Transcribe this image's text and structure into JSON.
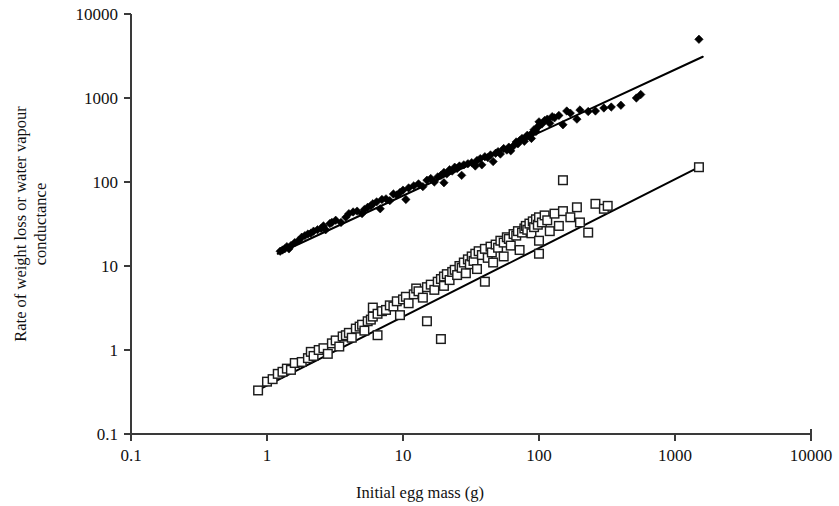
{
  "chart_data": {
    "type": "scatter",
    "title": "",
    "xlabel": "Initial egg mass (g)",
    "ylabel": "Rate of weight loss or water vapour conductance",
    "ylabel_line1": "Rate of weight loss or water vapour",
    "ylabel_line2": "conductance",
    "xscale": "log",
    "yscale": "log",
    "xlim": [
      0.1,
      10000
    ],
    "ylim": [
      0.1,
      10000
    ],
    "xticks": [
      "0.1",
      "1",
      "10",
      "100",
      "1000",
      "10000"
    ],
    "xtick_values": [
      0.1,
      1,
      10,
      100,
      1000,
      10000
    ],
    "yticks": [
      "0.1",
      "1",
      "10",
      "100",
      "1000",
      "10000"
    ],
    "ytick_values": [
      0.1,
      1,
      10,
      100,
      1000,
      10000
    ],
    "grid": false,
    "legend": false,
    "legend_position": "none",
    "marker_colors": {
      "rate_of_weight_loss": "#000000",
      "water_vapour_conductance": "#ffffff",
      "water_vapour_conductance_edge": "#1c1c1c",
      "trend_line": "#000000",
      "axis": "#3a3a3a"
    },
    "series": [
      {
        "name": "Rate of weight loss",
        "marker": "filled-diamond",
        "points": [
          [
            1.25,
            15.0
          ],
          [
            1.3,
            15.5
          ],
          [
            1.35,
            16.0
          ],
          [
            1.4,
            17.0
          ],
          [
            1.45,
            16.0
          ],
          [
            1.5,
            17.5
          ],
          [
            1.6,
            19.0
          ],
          [
            1.7,
            20.0
          ],
          [
            1.8,
            22.0
          ],
          [
            1.9,
            23.0
          ],
          [
            2.0,
            24.0
          ],
          [
            2.1,
            24.5
          ],
          [
            2.2,
            26.0
          ],
          [
            2.35,
            27.0
          ],
          [
            2.5,
            28.0
          ],
          [
            2.6,
            30.0
          ],
          [
            2.7,
            27.0
          ],
          [
            2.9,
            32.0
          ],
          [
            3.0,
            33.0
          ],
          [
            3.2,
            35.0
          ],
          [
            3.5,
            33.0
          ],
          [
            3.8,
            38.0
          ],
          [
            4.0,
            42.0
          ],
          [
            4.3,
            44.0
          ],
          [
            4.6,
            45.0
          ],
          [
            5.0,
            42.0
          ],
          [
            5.2,
            47.0
          ],
          [
            5.5,
            50.0
          ],
          [
            5.8,
            52.0
          ],
          [
            6.0,
            55.0
          ],
          [
            6.4,
            58.0
          ],
          [
            6.8,
            48.0
          ],
          [
            7.0,
            62.0
          ],
          [
            7.5,
            63.0
          ],
          [
            8.0,
            60.0
          ],
          [
            8.5,
            72.0
          ],
          [
            9.0,
            70.0
          ],
          [
            9.5,
            75.0
          ],
          [
            10.0,
            80.0
          ],
          [
            10.5,
            62.0
          ],
          [
            11.0,
            85.0
          ],
          [
            12.0,
            90.0
          ],
          [
            13.0,
            95.0
          ],
          [
            14.0,
            88.0
          ],
          [
            15.0,
            105.0
          ],
          [
            16.0,
            110.0
          ],
          [
            17.0,
            100.0
          ],
          [
            18.0,
            115.0
          ],
          [
            19.0,
            120.0
          ],
          [
            20.0,
            130.0
          ],
          [
            20.0,
            98.0
          ],
          [
            21.0,
            125.0
          ],
          [
            22.0,
            140.0
          ],
          [
            23.0,
            135.0
          ],
          [
            24.0,
            150.0
          ],
          [
            25.0,
            145.0
          ],
          [
            26.0,
            155.0
          ],
          [
            27.0,
            120.0
          ],
          [
            28.0,
            160.0
          ],
          [
            30.0,
            165.0
          ],
          [
            32.0,
            170.0
          ],
          [
            34.0,
            155.0
          ],
          [
            35.0,
            180.0
          ],
          [
            37.0,
            190.0
          ],
          [
            38.0,
            160.0
          ],
          [
            40.0,
            200.0
          ],
          [
            42.0,
            195.0
          ],
          [
            44.0,
            210.0
          ],
          [
            46.0,
            175.0
          ],
          [
            48.0,
            220.0
          ],
          [
            50.0,
            230.0
          ],
          [
            52.0,
            215.0
          ],
          [
            55.0,
            250.0
          ],
          [
            58.0,
            240.0
          ],
          [
            60.0,
            260.0
          ],
          [
            62.0,
            235.0
          ],
          [
            65.0,
            270.0
          ],
          [
            68.0,
            300.0
          ],
          [
            70.0,
            285.0
          ],
          [
            72.0,
            310.0
          ],
          [
            75.0,
            330.0
          ],
          [
            78.0,
            305.0
          ],
          [
            80.0,
            340.0
          ],
          [
            82.0,
            360.0
          ],
          [
            85.0,
            350.0
          ],
          [
            88.0,
            330.0
          ],
          [
            90.0,
            390.0
          ],
          [
            92.0,
            420.0
          ],
          [
            95.0,
            400.0
          ],
          [
            98.0,
            450.0
          ],
          [
            100.0,
            470.0
          ],
          [
            100.0,
            520.0
          ],
          [
            105.0,
            490.0
          ],
          [
            110.0,
            540.0
          ],
          [
            115.0,
            560.0
          ],
          [
            120.0,
            500.0
          ],
          [
            125.0,
            600.0
          ],
          [
            130.0,
            580.0
          ],
          [
            140.0,
            620.0
          ],
          [
            150.0,
            480.0
          ],
          [
            160.0,
            700.0
          ],
          [
            170.0,
            660.0
          ],
          [
            190.0,
            560.0
          ],
          [
            200.0,
            720.0
          ],
          [
            230.0,
            690.0
          ],
          [
            260.0,
            700.0
          ],
          [
            300.0,
            760.0
          ],
          [
            340.0,
            780.0
          ],
          [
            400.0,
            820.0
          ],
          [
            520.0,
            1000.0
          ],
          [
            560.0,
            1100.0
          ],
          [
            1500.0,
            5000.0
          ]
        ],
        "fit_line": {
          "x_start": 1.2,
          "y_start": 14.0,
          "x_end": 1600.0,
          "y_end": 3100.0
        }
      },
      {
        "name": "Water vapour conductance",
        "marker": "open-square",
        "points": [
          [
            0.86,
            0.33
          ],
          [
            1.0,
            0.42
          ],
          [
            1.1,
            0.45
          ],
          [
            1.2,
            0.52
          ],
          [
            1.3,
            0.55
          ],
          [
            1.4,
            0.6
          ],
          [
            1.5,
            0.58
          ],
          [
            1.6,
            0.7
          ],
          [
            1.8,
            0.72
          ],
          [
            2.0,
            0.8
          ],
          [
            2.1,
            0.95
          ],
          [
            2.2,
            0.85
          ],
          [
            2.4,
            1.0
          ],
          [
            2.6,
            1.05
          ],
          [
            2.8,
            0.9
          ],
          [
            3.0,
            1.2
          ],
          [
            3.2,
            1.3
          ],
          [
            3.4,
            1.1
          ],
          [
            3.6,
            1.45
          ],
          [
            3.8,
            1.5
          ],
          [
            4.0,
            1.6
          ],
          [
            4.2,
            1.4
          ],
          [
            4.5,
            1.8
          ],
          [
            4.8,
            1.9
          ],
          [
            5.0,
            2.0
          ],
          [
            5.2,
            1.7
          ],
          [
            5.5,
            2.2
          ],
          [
            5.8,
            2.3
          ],
          [
            6.0,
            2.5
          ],
          [
            6.0,
            3.2
          ],
          [
            6.5,
            2.7
          ],
          [
            6.5,
            1.5
          ],
          [
            7.0,
            2.9
          ],
          [
            7.5,
            3.0
          ],
          [
            8.0,
            3.4
          ],
          [
            8.5,
            3.3
          ],
          [
            9.0,
            3.8
          ],
          [
            9.5,
            2.6
          ],
          [
            10.0,
            4.0
          ],
          [
            10.5,
            4.3
          ],
          [
            11.0,
            3.6
          ],
          [
            12.0,
            4.6
          ],
          [
            12.5,
            5.4
          ],
          [
            13.0,
            5.0
          ],
          [
            14.0,
            4.2
          ],
          [
            15.0,
            5.6
          ],
          [
            15.0,
            2.2
          ],
          [
            16.0,
            6.0
          ],
          [
            17.0,
            5.2
          ],
          [
            18.0,
            6.5
          ],
          [
            19.0,
            7.0
          ],
          [
            19.0,
            1.35
          ],
          [
            20.0,
            7.5
          ],
          [
            20.0,
            5.8
          ],
          [
            21.0,
            8.0
          ],
          [
            22.0,
            6.8
          ],
          [
            23.0,
            8.5
          ],
          [
            24.0,
            9.0
          ],
          [
            25.0,
            7.8
          ],
          [
            26.0,
            10.0
          ],
          [
            27.0,
            9.5
          ],
          [
            28.0,
            11.0
          ],
          [
            29.0,
            8.2
          ],
          [
            30.0,
            12.0
          ],
          [
            31.0,
            10.5
          ],
          [
            32.0,
            13.0
          ],
          [
            33.0,
            11.5
          ],
          [
            34.0,
            14.0
          ],
          [
            35.0,
            9.2
          ],
          [
            36.0,
            15.0
          ],
          [
            38.0,
            13.5
          ],
          [
            40.0,
            16.0
          ],
          [
            40.0,
            6.5
          ],
          [
            42.0,
            12.5
          ],
          [
            44.0,
            17.0
          ],
          [
            45.0,
            14.5
          ],
          [
            46.0,
            11.0
          ],
          [
            48.0,
            18.0
          ],
          [
            50.0,
            16.5
          ],
          [
            52.0,
            20.0
          ],
          [
            55.0,
            19.0
          ],
          [
            55.0,
            13.0
          ],
          [
            58.0,
            22.0
          ],
          [
            60.0,
            21.0
          ],
          [
            62.0,
            17.5
          ],
          [
            65.0,
            24.0
          ],
          [
            68.0,
            23.0
          ],
          [
            70.0,
            26.0
          ],
          [
            72.0,
            15.5
          ],
          [
            75.0,
            25.0
          ],
          [
            78.0,
            28.0
          ],
          [
            80.0,
            30.0
          ],
          [
            82.0,
            27.0
          ],
          [
            85.0,
            32.0
          ],
          [
            88.0,
            24.5
          ],
          [
            90.0,
            34.0
          ],
          [
            92.0,
            29.0
          ],
          [
            95.0,
            36.0
          ],
          [
            98.0,
            31.0
          ],
          [
            100.0,
            38.0
          ],
          [
            100.0,
            20.0
          ],
          [
            100.0,
            14.0
          ],
          [
            105.0,
            33.0
          ],
          [
            110.0,
            40.0
          ],
          [
            115.0,
            35.0
          ],
          [
            120.0,
            26.0
          ],
          [
            130.0,
            42.0
          ],
          [
            140.0,
            30.0
          ],
          [
            150.0,
            105.0
          ],
          [
            150.0,
            45.0
          ],
          [
            170.0,
            38.0
          ],
          [
            190.0,
            50.0
          ],
          [
            200.0,
            33.0
          ],
          [
            230.0,
            25.0
          ],
          [
            260.0,
            55.0
          ],
          [
            300.0,
            48.0
          ],
          [
            320.0,
            52.0
          ],
          [
            1500.0,
            150.0
          ]
        ],
        "fit_line": {
          "x_start": 0.85,
          "y_start": 0.33,
          "x_end": 1500.0,
          "y_end": 150.0
        }
      }
    ]
  },
  "axis": {
    "x_title": "Initial egg mass (g)",
    "y_title_line1": "Rate of weight loss or water vapour",
    "y_title_line2": "conductance"
  }
}
